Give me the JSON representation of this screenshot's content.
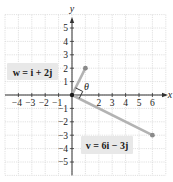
{
  "axes": {
    "x_label": "x",
    "y_label": "y",
    "x_ticks": [
      "-4",
      "-3",
      "-2",
      "-1",
      "2",
      "3",
      "4",
      "5",
      "6"
    ],
    "x_tick_values": [
      -4,
      -3,
      -2,
      -1,
      2,
      3,
      4,
      5,
      6
    ],
    "y_ticks": [
      "5",
      "4",
      "3",
      "2",
      "1",
      "-1",
      "-2",
      "-3",
      "-4",
      "-5"
    ],
    "y_tick_values": [
      5,
      4,
      3,
      2,
      1,
      -1,
      -2,
      -3,
      -4,
      -5
    ],
    "xlim": [
      -5,
      7
    ],
    "ylim": [
      -6,
      6
    ]
  },
  "vectors": {
    "w": {
      "label": "w = i + 2j",
      "x": 1,
      "y": 2
    },
    "v": {
      "label": "v = 6i − 3j",
      "x": 6,
      "y": -3
    }
  },
  "angle_label": "θ",
  "colors": {
    "grid": "#d9d9d9",
    "axis": "#333333",
    "vector": "#b3b3b3",
    "endpoint": "#8a8a8a",
    "label_bg": "#e8e8e8",
    "text": "#1a1a1a"
  }
}
